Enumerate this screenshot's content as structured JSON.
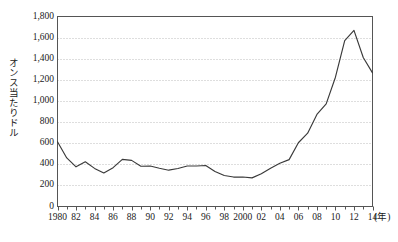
{
  "chart_data": {
    "type": "line",
    "title": "",
    "xlabel": "(年)",
    "ylabel": "オンス当たりドル",
    "ylim": [
      0,
      1800
    ],
    "xlim": [
      1980,
      2014
    ],
    "grid": true,
    "legend": "none",
    "y_ticks": [
      "0",
      "200",
      "400",
      "600",
      "800",
      "1,000",
      "1,200",
      "1,400",
      "1,600",
      "1,800"
    ],
    "y_tick_values": [
      0,
      200,
      400,
      600,
      800,
      1000,
      1200,
      1400,
      1600,
      1800
    ],
    "x_ticks": [
      "1980",
      "82",
      "84",
      "86",
      "88",
      "90",
      "92",
      "94",
      "96",
      "98",
      "2000",
      "02",
      "04",
      "06",
      "08",
      "10",
      "12",
      "14"
    ],
    "x_tick_values": [
      1980,
      1982,
      1984,
      1986,
      1988,
      1990,
      1992,
      1994,
      1996,
      1998,
      2000,
      2002,
      2004,
      2006,
      2008,
      2010,
      2012,
      2014
    ],
    "x": [
      1980,
      1981,
      1982,
      1983,
      1984,
      1985,
      1986,
      1987,
      1988,
      1989,
      1990,
      1991,
      1992,
      1993,
      1994,
      1995,
      1996,
      1997,
      1998,
      1999,
      2000,
      2001,
      2002,
      2003,
      2004,
      2005,
      2006,
      2007,
      2008,
      2009,
      2010,
      2011,
      2012,
      2013,
      2014
    ],
    "values": [
      613,
      460,
      376,
      424,
      361,
      317,
      368,
      447,
      437,
      381,
      384,
      362,
      344,
      360,
      384,
      384,
      388,
      331,
      294,
      279,
      279,
      271,
      310,
      363,
      409,
      444,
      604,
      695,
      872,
      972,
      1225,
      1572,
      1669,
      1411,
      1266
    ],
    "series_name": "金価格",
    "line_color": "#3a3a3a",
    "grid_color": "#bdbdbd",
    "axis_color": "#555555",
    "background": "#ffffff"
  }
}
